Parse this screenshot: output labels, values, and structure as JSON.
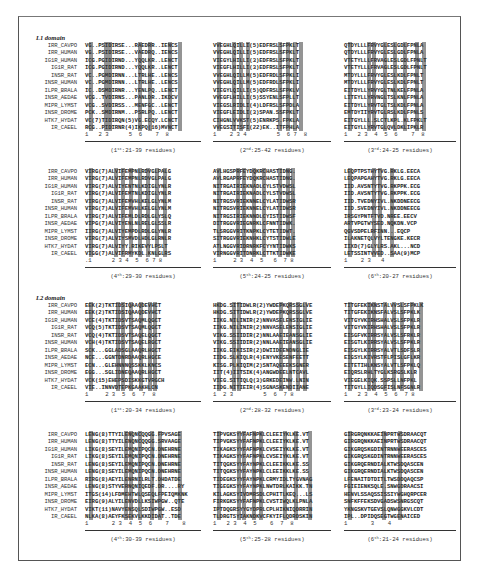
{
  "figure": {
    "species": [
      "IRR_CAVPO",
      "IRR_HUMAN",
      "IG1R_HUMAN",
      "IG1R_RAT",
      "INSR_RAT",
      "INSR_HUMAN",
      "ILPR_BRALA",
      "INSR_AEDAE",
      "MIPR_LYMST",
      "INSR_DROME",
      "HTK7_HYDAT",
      "IR_CAEEL"
    ],
    "domains": [
      {
        "title": "L1 domain",
        "blocks": [
          {
            "ordinal": "1",
            "suffix": "st",
            "range": ":21-39 residues)",
            "positions": "1   2 3      5  6    7  8",
            "rows": [
              "VG..PSIDIRSE...RAEDRR..IENCS",
              "VG..PSIDIRSE...VAEDRQ..IENCS",
              "ICG.PGIDIRND...YQQLKR..LENCT",
              "ICG.PGIDIRND...YQQLKR..LENCT",
              "VC..PGMDIRNN...LTRLHE..LENCS",
              "VC..PGMDIRNN...LTRLHE..LENCS",
              "IC..DSMDIRNR...YENLPQ..LENCT",
              "VCG..TVDIRNS...PANLDR..IKDCV",
              "VCG..SVDIRSS...MENFGC..LENCT",
              "PCK..SMDIRNM...PSRLPQ..LENCT",
              "VC(7)TIDIRQN(5)VG.ECQY.LCNCT",
              "RCG..PIDIRNR(4)IKPQ(16)MVNCT"
            ],
            "marks": [
              1.5,
              6,
              7,
              16,
              19,
              25,
              28
            ]
          },
          {
            "ordinal": "2",
            "suffix": "nd",
            "range": ":25-42 residues)",
            "positions": "1    2 3 4         5  6 7  8",
            "rows": [
              "VVEGHLQILLI(5)EDFRSLSFPKLT",
              "VVEGHLQILLI(5)EDFRSLSFPKLT",
              "VIEGYLHILLI(3)EDFRSLSFPKLT",
              "VIEGFLHILLI(3)EDFRSLSFPKLT",
              "VVEGHLQILLM(5)EDFRDLSFPKLI",
              "VVEGHLQILLM(5)EDFRDLSFPKLI",
              "VIEGYLQILLI(5)QDFRSLSFPKLV",
              "VVEGFLHILLI(5)SSYENLSFPLLT",
              "VIEGSLRIDLI(4)LDFRSLSFPDLA",
              "VIEGFLEIDLI(3)SPAN.SSFPKLT",
              "CIHGNLVVKST(5)ENRKPS.FPKLA",
              "VVEGSITISFI(22)EK..ITFPHLA"
            ],
            "marks": [
              1.5,
              6,
              8,
              10,
              19.5,
              22,
              24,
              26
            ]
          },
          {
            "ordinal": "3",
            "suffix": "rd",
            "range": ":24-25 residues)",
            "positions": "1   2 3  4  5  6    7  8",
            "rows": [
              "QTDYLLLFRVYGLESLGDLFPNLA",
              "QTDYLLLFRVYGLESLGDLFPNLA",
              "VTETYLLLFRVAGLESLGDLFPNLT",
              "VTETYLLLFRVAGLESLGDLFPNLT",
              "MTDYLLLFRVYGLESLKDLFPNLT",
              "MTDYLLLFRVYGLESLKDLFPNLT",
              "EITDYLLYRVYGLTNLKELFPNLA",
              "LITEYLLYRVNGLTSLKNLFPNLA",
              "EITDYLLYRVTGLTSLKDLFPNLA",
              "EMTDYIIYRVTGLRSLKDLFPNLS",
              "EITGYLLL.SLCTLKPL.KLFPKLT",
              "EITGYLLYRVTGLQVLDKLIPKLR"
            ],
            "marks": [
              1.5,
              7,
              8.5,
              12,
              15,
              18,
              21.5,
              23.5
            ]
          },
          {
            "ordinal": "4",
            "suffix": "th",
            "range": ":29-30 residues)",
            "positions": ".1      2 3 4  5  6 7 8",
            "rows": [
              "VIRG(7)ALVIFEMPNLRDVGLPALG",
              "VIRG(7)ALVIFEMPNLRDVGLPALG",
              "VIRG(7)ALVIYENTNLKDIGLYNLR",
              "VIRG(7)ALVIFEMTNLKDIGLYNLR",
              "VIRG(7)ALVIFEMVHLKELGLYNLM",
              "VIRG(7)ALVIFEMVHLKELGLYNLM",
              "VIRG(7)ALVIFEMLDLRDLGLYSLQ",
              "VIPG(7)ALVIYENLNLRELGLSSLR",
              "IIRG(7)ALVIYEMPDLRDLGLYNLR",
              "VIRG(7)ALVIYSMVDLHDLGLRNLR",
              "VIRG(7)ALVIYY.RIKEVYLPSLT",
              "VIGG(7)ALVIFRMYKDL.KNLGLRS"
            ],
            "marks": [
              1.5,
              9,
              11,
              13.5,
              16,
              18.5,
              21,
              23.5
            ]
          },
          {
            "ordinal": "5",
            "suffix": "th",
            "range": ":24-25 residues)",
            "positions": "1     2 3  4  5   6  7 8",
            "rows": [
              "AVLHGSPRFEYDQKRCHASTIDNG.",
              "AVLRGAPRFEYDQKRCHASTIDNG.",
              "NITRGAIRIEKNADLCYLSTVDWSL",
              "NITRGAIRIEKNADLCYLSTVDWSL",
              "NITRGSVRIEKNNELCYLATIDWSR",
              "NITRGSVRIEKNNELCYLATIDWSR",
              "NITRGSIRIEKNNDLCYISTIDWSF",
              "DITRGGVRIEGNRKLCFNNTIDWK.",
              "TLSRGGVRITKNPKLCYTETIDWT.",
              "SITRGGVRIEKNHKLCYTSTIDWLE",
              "ATLNGGVRIDRNRKFCYYNTIDWKS",
              "VIRNGGVRITDNRKLCTTKTIDWKE"
            ],
            "marks": [
              1.5,
              7,
              9,
              12,
              15,
              19.5,
              22,
              23.5
            ]
          },
          {
            "ordinal": "6",
            "suffix": "th",
            "range": ":20-27 residues)",
            "positions": "1    2 3   4",
            "rows": [
              "LEQPTPSTHYTVG.RKLG.EECA",
              "LEQPAPGAHYTVG.RKLG.EECA",
              "IID.AVSNTYTVG.RKPPK.ECG",
              "IID.AVSNTYTVG.RKPPK.ECG",
              "IID.TVEDNYIVL.NKDDNEECG",
              "IID.SVEDNYIVL.NKDDNEECG",
              "IRSGYPNTFTVD.NREE.EECV",
              "ARTVPGTWYSED.NQKDN.VCP",
              "QGVSDPELRFINN...EQCP",
              "ILAKNETQLVYLTENGKE.KECR",
              "IIXD(7)GLYLRS.AKL...NCD",
              "LETSSINTVVED..SAA(9)MCP"
            ],
            "marks": [
              1.5,
              8.5,
              10.5,
              14
            ]
          }
        ]
      },
      {
        "title": "L2 domain",
        "blocks": [
          {
            "ordinal": "1",
            "suffix": "st",
            "range": ":20-34 residues)",
            "positions": "1     2 3  5  6  7  8",
            "rows": [
              "EEK(2)TKTIDSIQAAQDEVHCT",
              "EEK(2)TKTIDSIQAAQDEVHCT",
              "VCE(4)TKTIDSVTSAQMLQGCT",
              "VCQ(5)TKTIDSVTSAQMLQGCT",
              "VCQ(4)TKTIDSVTSAQELQGCT",
              "VCH(4)TKTIDSVTSAQELRGCT",
              "SCK...GGLADSGLAAQRLHGCT",
              "NCE...GGNTDNRDAAQRLHGCE",
              "ECN...GLEHNNNQSSKKLKNCS",
              "EGG...SGLIDNEQAAQRLHGCT",
              "VCK(15)EHEPSDISKKGTVRGCH",
              "VIE..INNVDTEPKGAAKHLCN"
            ],
            "marks": [
              1.5,
              9.5,
              11,
              13.5,
              16.5,
              19,
              20.5
            ]
          },
          {
            "ordinal": "2",
            "suffix": "nd",
            "range": ":28-32 residues)",
            "positions": "1  2 3         5  6  7 8",
            "rows": [
              "HKDG.SITIDWLR(2)YWDEPKQRSSGLVE",
              "HKDG.SITIDWLR(2)YWDEPKQRSSGLVE",
              "IIKG.NILINIR(2)NNVASELENSIGLIE",
              "IIKG.NILINIR(2)NNVASELENSIGLIE",
              "VIKG.SSIIDIR(2)NNLAAEIEANSGLIE",
              "VIKG.SSIIDIR(2)NNLAAEIEANSGLIE",
              "IIKG.EIKISIR(2)DWIIDEENDNGLIE",
              "IIDG.SLKIQLR(4)ENYVKESENFEETT",
              "KISG.PLKIQIM(2)SNTAQEEEKSGNER",
              "IIT(4)IITSIK(4)ANGWDEELNTCAVL",
              "VIEG.SITIQLQ(3)GRKEDEINW.LNIN",
              "IIDG.NITIEIR(4)SGNASKENDIIANE"
            ],
            "marks": [
              1.5,
              6,
              7.5,
              20,
              22.5,
              25,
              27
            ]
          },
          {
            "ordinal": "3",
            "suffix": "rd",
            "range": ":23-24 residues)",
            "positions": "1   2 3  4  5  6  7 8",
            "rows": [
              "TITGFEKIKNSTALVVSLSFPKLK",
              "TITGFEKIKNSFALVSLSFPKLK",
              "VITGYVKIRHSHALVSLSFPKLR",
              "VITGYVKIRHSHALVSLSFPKLR",
              "EISGFVKIRRSYALVSLSFRKLR",
              "EISGTLKIRRSYALVSLSFPKLR",
              "EISGYLKIRRSYALVTLSDFSLR",
              "EIGSYLKIVRSTFLPISLGFLKR",
              "EITETIHLKNSYALVTLSFPKLQ",
              "EIQRSLRHLTYGLKSRGSLKLR",
              "VIEGELKIQK.SSPSLLNFPKL",
              "TITGYLLIQDSGFISLNFSGNLR"
            ],
            "marks": [
              1.5,
              7,
              8.5,
              12,
              14.5,
              17,
              20,
              22.5
            ]
          },
          {
            "ordinal": "4",
            "suffix": "th",
            "range": ":30-39 residues)",
            "positions": "1       2 3  4  5  6    7    8",
            "rows": [
              "LENG(8)TTYILENQNCQQGG.FPVSAGE",
              "LENG(8)TTYILENQNCQQGG.SRVAAGE",
              "LIKG(8)SEYILEMQNIPQCN.DNEHRNE",
              "LIKG(8)SEYILEMQNIPQCN.DNEHRNE",
              "LENG(8)SEYILEMQNIPQCN.DNEHRNE",
              "LENG(8)SEYILEMQNIPQCN.DNEHRNE",
              "RIRG(8)AEYILENRNILRLT.DHDATDE",
              "LENG(8)STYVERNQNIQEDF.DR....RY",
              "ITGS(14)LFDMEHTWLQSEQLFPEIQMKNK",
              "EIRG(9)ALYILENVDLLKSIWPGW..QTE",
              "VIKT(11)NAVYENSQLSDIWPGW..ESD",
              "NLKA(8)AEYFKSEKVLKKDIDAT..TDE"
            ],
            "marks": [
              1.5,
              12,
              13.5,
              16,
              19.5,
              22,
              28
            ]
          },
          {
            "ordinal": "5",
            "suffix": "th",
            "range": ":25-28 residues)",
            "positions": "1   2 3  4  5    6  7  8",
            "rows": [
              "TIPVGKSYYFAFNPKLCLEEIYKLKE.VT",
              "TIPVGKSYYFAFNPKLCLEEIYKLKE.VT",
              "TIKAGKSYYFAFNPKLCVSEIYKLKE.VT",
              "TIKAGKSYYFAFNPKLCVSEIYKLKE.VT",
              "TITQGKSYYFAYNPKLCLEEIKKLKE.SS",
              "TITQGKSYYFAYNPKLCLEEIKKLKE.SS",
              "TIDEGKSYYFAYNPKLCRMYIDLTYGVNAG",
              "TIGEGKSYYFAYNPKLNWTDRLKAIKK.TN",
              "KILAGKSYIVDMRSDLCPHITLKEQ...LS",
              "FIRKGKSYYFAFNPKLCVSTIWQLKLPNLA",
              "IPTDQGRSYYGYDPRLCPLHIKNIQDRRIN",
              "TLDRGTSYIAKNDKVCFKYIFLQDRDSKIN"
            ],
            "marks": [
              1.5,
              7.5,
              9,
              12,
              14,
              21,
              24.5,
              28.5
            ]
          },
          {
            "ordinal": "6",
            "suffix": "th",
            "range": ":21-24 residues)",
            "positions": "1       3    4",
            "rows": [
              "GIRGRQNKKAEINPRTWSDRAACQT",
              "GIRGRQNKKAEINPRTWSDRAACQT",
              "GIKGRQSKGDINTRNNWEERASCES",
              "GIKGRQSKGDINTRNNWEERASCES",
              "GIKGRQERNDIALKTWSDQASCEN",
              "GIKGRQERNDIALKTWSDQASCEN",
              "LFENAITDTDITLTWSDDQAQCSP",
              "FGIEIENKSQLE.SNWGDRAACSI",
              "HENVLSSAQSSISSIYWGHQRPCER",
              "SNFKFFEKSDVGADSWSNRGSCQT",
              "YKNGSKVTGEVSLQNWGGKVLCDT",
              "IPL..DPIDQSEGTWGENAICED"
            ],
            "marks": [
              1.5,
              11.5,
              16.5
            ]
          }
        ]
      }
    ]
  }
}
